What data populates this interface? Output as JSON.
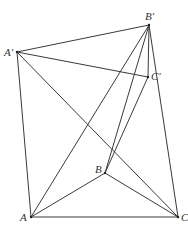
{
  "figure": {
    "type": "geometry-diagram",
    "stroke_color": "#3a3a3a",
    "points": {
      "A": {
        "label": "A",
        "x": 31,
        "y": 217,
        "lx": 20,
        "ly": 221
      },
      "B": {
        "label": "B",
        "x": 105,
        "y": 173,
        "lx": 95,
        "ly": 173
      },
      "C": {
        "label": "C",
        "x": 178,
        "y": 217,
        "lx": 181,
        "ly": 221
      },
      "Ap": {
        "label": "A′",
        "x": 17,
        "y": 52,
        "lx": 4,
        "ly": 56
      },
      "Bp": {
        "label": "B′",
        "x": 149,
        "y": 25,
        "lx": 145,
        "ly": 20
      },
      "Cp": {
        "label": "C′",
        "x": 148,
        "y": 77,
        "lx": 151,
        "ly": 80
      }
    },
    "segments": [
      [
        "Ap",
        "Bp"
      ],
      [
        "Ap",
        "Cp"
      ],
      [
        "Bp",
        "Cp"
      ],
      [
        "Ap",
        "A"
      ],
      [
        "Ap",
        "C"
      ],
      [
        "Bp",
        "A"
      ],
      [
        "Bp",
        "B"
      ],
      [
        "Bp",
        "C"
      ],
      [
        "Cp",
        "B"
      ],
      [
        "A",
        "B"
      ],
      [
        "B",
        "C"
      ],
      [
        "A",
        "C"
      ]
    ]
  }
}
